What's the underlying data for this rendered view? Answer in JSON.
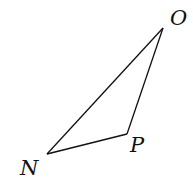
{
  "diagram": {
    "type": "triangle",
    "stroke_color": "#111111",
    "background": "#ffffff",
    "vertices": [
      {
        "name": "O",
        "x": 163,
        "y": 28,
        "label_x": 170,
        "label_y": 25
      },
      {
        "name": "P",
        "x": 127,
        "y": 134,
        "label_x": 130,
        "label_y": 152
      },
      {
        "name": "N",
        "x": 47,
        "y": 154,
        "label_x": 20,
        "label_y": 175
      }
    ],
    "edges": [
      [
        "N",
        "O"
      ],
      [
        "O",
        "P"
      ],
      [
        "P",
        "N"
      ]
    ]
  }
}
